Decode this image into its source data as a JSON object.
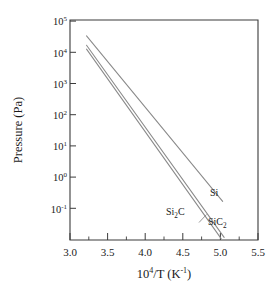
{
  "chart_data": {
    "type": "line",
    "title": "",
    "xlabel": "10^4/T (K^-1)",
    "ylabel": "Pressure (Pa)",
    "xlim": [
      3.0,
      5.5
    ],
    "ylim": [
      0.02,
      100000
    ],
    "yscale": "log",
    "xscale": "linear",
    "grid": false,
    "legend_position": "inline-annotations",
    "xticks": [
      3.0,
      3.5,
      4.0,
      4.5,
      5.0,
      5.5
    ],
    "xtick_labels": [
      "3.0",
      "3.5",
      "4.0",
      "4.5",
      "5.0",
      "5.5"
    ],
    "xminor_step": 0.25,
    "yticks": [
      0.1,
      1,
      10,
      100,
      1000,
      10000,
      100000
    ],
    "ytick_labels": [
      "10⁻¹",
      "10⁰",
      "10¹",
      "10²",
      "10³",
      "10⁴",
      "10⁵"
    ],
    "ytick_exponents": [
      "-1",
      "0",
      "1",
      "2",
      "3",
      "4",
      "5"
    ],
    "series": [
      {
        "name": "Si",
        "label": "Si",
        "color": "#8a8a8a",
        "x": [
          3.22,
          5.03
        ],
        "y": [
          33000,
          0.3
        ],
        "endpoints_note": "upper-left 3.3e4 Pa to lower-right 0.30 Pa"
      },
      {
        "name": "Si2C",
        "label": "Si₂C",
        "color": "#8a8a8a",
        "x": [
          3.22,
          5.01
        ],
        "y": [
          13000,
          0.022
        ],
        "endpoints_note": "steepest line, exits bottom axis near 5.0"
      },
      {
        "name": "SiC2",
        "label": "SiC₂",
        "color": "#8a8a8a",
        "x": [
          3.22,
          5.05
        ],
        "y": [
          17000,
          0.024
        ],
        "endpoints_note": "middle slope, exits bottom axis near 5.05"
      }
    ],
    "annotations": [
      {
        "text": "Si",
        "x": 5.12,
        "y": 0.35,
        "series": "Si"
      },
      {
        "text": "Si₂C",
        "x": 4.33,
        "y": 0.075,
        "series": "Si2C"
      },
      {
        "text": "SiC₂",
        "x": 5.06,
        "y": 0.055,
        "series": "SiC2"
      }
    ]
  },
  "axes": {
    "y_title_text": "Pressure (Pa)",
    "x_title_main": "10",
    "x_title_sup1": "4",
    "x_title_mid": "/T (K",
    "x_title_sup2": "-1",
    "x_title_end": ")"
  },
  "colors": {
    "axis": "#3b3b3b",
    "curve": "#8a8a8a",
    "text": "#1a1a1a",
    "background": "#ffffff"
  }
}
